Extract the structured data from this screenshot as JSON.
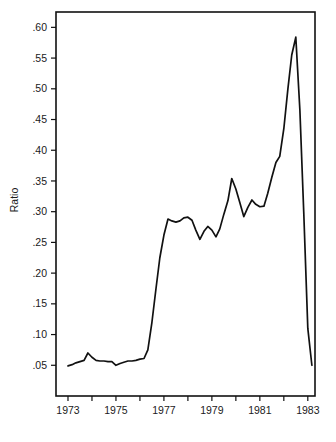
{
  "chart_data": {
    "type": "line",
    "title": "",
    "subtitle": "",
    "xlabel": "",
    "ylabel": "Ratio",
    "xlim": [
      1972.5,
      1983.3
    ],
    "ylim": [
      0.0,
      0.625
    ],
    "grid": false,
    "legend": null,
    "legend_position": "none",
    "x_tick_labels": [
      "1973",
      "",
      "1975",
      "",
      "1977",
      "",
      "1979",
      "",
      "1981",
      "",
      "1983"
    ],
    "x_tick_values": [
      1973,
      1974,
      1975,
      1976,
      1977,
      1978,
      1979,
      1980,
      1981,
      1982,
      1983
    ],
    "y_tick_labels": [
      ".05",
      ".10",
      ".15",
      ".20",
      ".25",
      ".30",
      ".35",
      ".40",
      ".45",
      ".50",
      ".55",
      ".60"
    ],
    "y_tick_values": [
      0.05,
      0.1,
      0.15,
      0.2,
      0.25,
      0.3,
      0.35,
      0.4,
      0.45,
      0.5,
      0.55,
      0.6
    ],
    "series": [
      {
        "name": "Ratio",
        "color": "#111111",
        "x": [
          1973.0,
          1973.17,
          1973.33,
          1973.5,
          1973.67,
          1973.83,
          1974.0,
          1974.17,
          1974.33,
          1974.5,
          1974.67,
          1974.83,
          1975.0,
          1975.17,
          1975.33,
          1975.5,
          1975.67,
          1975.83,
          1976.0,
          1976.17,
          1976.33,
          1976.5,
          1976.67,
          1976.83,
          1977.0,
          1977.17,
          1977.33,
          1977.5,
          1977.67,
          1977.83,
          1978.0,
          1978.17,
          1978.33,
          1978.5,
          1978.67,
          1978.83,
          1979.0,
          1979.17,
          1979.33,
          1979.5,
          1979.67,
          1979.83,
          1980.0,
          1980.17,
          1980.33,
          1980.5,
          1980.67,
          1980.83,
          1981.0,
          1981.17,
          1981.33,
          1981.5,
          1981.67,
          1981.83,
          1982.0,
          1982.17,
          1982.33,
          1982.5,
          1982.67,
          1982.83,
          1983.0,
          1983.17
        ],
        "y": [
          0.049,
          0.051,
          0.054,
          0.056,
          0.058,
          0.07,
          0.063,
          0.058,
          0.057,
          0.057,
          0.056,
          0.056,
          0.05,
          0.053,
          0.055,
          0.057,
          0.057,
          0.058,
          0.06,
          0.061,
          0.075,
          0.12,
          0.175,
          0.225,
          0.262,
          0.288,
          0.285,
          0.283,
          0.285,
          0.29,
          0.291,
          0.286,
          0.27,
          0.255,
          0.268,
          0.276,
          0.27,
          0.259,
          0.272,
          0.296,
          0.318,
          0.354,
          0.337,
          0.314,
          0.292,
          0.307,
          0.319,
          0.312,
          0.308,
          0.309,
          0.33,
          0.356,
          0.38,
          0.39,
          0.435,
          0.5,
          0.555,
          0.584,
          0.465,
          0.3,
          0.11,
          0.05
        ]
      }
    ],
    "annotations": []
  },
  "axis": {
    "y_title": "Ratio"
  },
  "caption": {
    "partial_text": ""
  }
}
